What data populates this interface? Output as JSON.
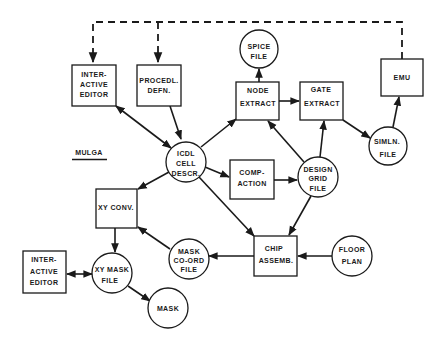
{
  "diagram": {
    "label": "MULGA",
    "nodes": {
      "interactive_editor_top": {
        "shape": "box",
        "lines": [
          "INTER-",
          "ACTIVE",
          "EDITOR"
        ]
      },
      "procedl_defn": {
        "shape": "box",
        "lines": [
          "PROCEDL.",
          "DEFN."
        ]
      },
      "spice_file": {
        "shape": "circle",
        "lines": [
          "SPICE",
          "FILE"
        ]
      },
      "node_extract": {
        "shape": "box",
        "lines": [
          "NODE",
          "EXTRACT"
        ]
      },
      "gate_extract": {
        "shape": "box",
        "lines": [
          "GATE",
          "EXTRACT"
        ]
      },
      "emu": {
        "shape": "box",
        "lines": [
          "EMU"
        ]
      },
      "simln_file": {
        "shape": "circle",
        "lines": [
          "SIMLN.",
          "FILE"
        ]
      },
      "icdl_cell_descr": {
        "shape": "circle",
        "lines": [
          "ICDL",
          "CELL",
          "DESCR."
        ]
      },
      "compaction": {
        "shape": "box",
        "lines": [
          "COMP-",
          "ACTION"
        ]
      },
      "design_grid_file": {
        "shape": "circle",
        "lines": [
          "DESIGN",
          "GRID",
          "FILE"
        ]
      },
      "xy_conv": {
        "shape": "box",
        "lines": [
          "XY CONV."
        ]
      },
      "mask_coord_file": {
        "shape": "circle",
        "lines": [
          "MASK",
          "CO-ORD",
          "FILE"
        ]
      },
      "chip_assemb": {
        "shape": "box",
        "lines": [
          "CHIP",
          "ASSEMB."
        ]
      },
      "floor_plan": {
        "shape": "circle",
        "lines": [
          "FLOOR",
          "PLAN"
        ]
      },
      "interactive_editor_bottom": {
        "shape": "box",
        "lines": [
          "INTER-",
          "ACTIVE",
          "EDITOR"
        ]
      },
      "xy_mask_file": {
        "shape": "circle",
        "lines": [
          "XY MASK",
          "FILE"
        ]
      },
      "mask": {
        "shape": "circle",
        "lines": [
          "MASK"
        ]
      }
    },
    "edges": [
      {
        "from": "interactive_editor_top",
        "to": "icdl_cell_descr",
        "style": "solid",
        "bidirectional": true
      },
      {
        "from": "procedl_defn",
        "to": "icdl_cell_descr",
        "style": "solid"
      },
      {
        "from": "icdl_cell_descr",
        "to": "node_extract",
        "style": "solid"
      },
      {
        "from": "icdl_cell_descr",
        "to": "compaction",
        "style": "solid"
      },
      {
        "from": "icdl_cell_descr",
        "to": "xy_conv",
        "style": "solid"
      },
      {
        "from": "icdl_cell_descr",
        "to": "chip_assemb",
        "style": "solid"
      },
      {
        "from": "node_extract",
        "to": "spice_file",
        "style": "solid"
      },
      {
        "from": "node_extract",
        "to": "gate_extract",
        "style": "solid"
      },
      {
        "from": "gate_extract",
        "to": "simln_file",
        "style": "solid"
      },
      {
        "from": "simln_file",
        "to": "emu",
        "style": "solid"
      },
      {
        "from": "compaction",
        "to": "design_grid_file",
        "style": "solid"
      },
      {
        "from": "design_grid_file",
        "to": "node_extract",
        "style": "solid"
      },
      {
        "from": "design_grid_file",
        "to": "gate_extract",
        "style": "solid"
      },
      {
        "from": "design_grid_file",
        "to": "chip_assemb",
        "style": "solid"
      },
      {
        "from": "floor_plan",
        "to": "chip_assemb",
        "style": "solid"
      },
      {
        "from": "chip_assemb",
        "to": "mask_coord_file",
        "style": "solid"
      },
      {
        "from": "mask_coord_file",
        "to": "xy_conv",
        "style": "solid"
      },
      {
        "from": "xy_conv",
        "to": "xy_mask_file",
        "style": "solid"
      },
      {
        "from": "interactive_editor_bottom",
        "to": "xy_mask_file",
        "style": "solid",
        "bidirectional": true
      },
      {
        "from": "xy_mask_file",
        "to": "mask",
        "style": "solid"
      },
      {
        "from": "emu",
        "to": "interactive_editor_top",
        "style": "dashed"
      },
      {
        "from": "emu",
        "to": "procedl_defn",
        "style": "dashed"
      }
    ]
  }
}
